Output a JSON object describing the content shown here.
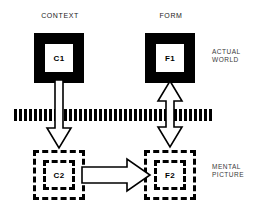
{
  "diagram": {
    "title_labels": {
      "context": "CONTEXT",
      "form": "FORM"
    },
    "tier_labels": {
      "actual_world": "ACTUAL\nWORLD",
      "mental_picture": "MENTAL\nPICTURE"
    },
    "nodes": [
      {
        "id": "c1",
        "label": "C1",
        "style": "solid-filled-square",
        "tier": "actual-world",
        "column": "context"
      },
      {
        "id": "f1",
        "label": "F1",
        "style": "solid-filled-square",
        "tier": "actual-world",
        "column": "form"
      },
      {
        "id": "c2",
        "label": "C2",
        "style": "dashed-square",
        "tier": "mental-picture",
        "column": "context"
      },
      {
        "id": "f2",
        "label": "F2",
        "style": "dashed-square",
        "tier": "mental-picture",
        "column": "form"
      }
    ],
    "edges": [
      {
        "id": "c1-c2",
        "from": "c1",
        "to": "c2",
        "direction": "down",
        "style": "hollow-block-arrow"
      },
      {
        "id": "f1-f2",
        "from": "f1",
        "to": "f2",
        "direction": "bidirectional-vertical",
        "style": "hollow-block-arrow"
      },
      {
        "id": "c2-f2",
        "from": "c2",
        "to": "f2",
        "direction": "right",
        "style": "hollow-block-arrow"
      }
    ],
    "barrier": {
      "name": "perception-barrier",
      "style": "thick-vertical-dashes",
      "dash_count": 40
    },
    "colors": {
      "ink": "#000000",
      "background": "#ffffff",
      "label_text": "#1a1a1a",
      "tier_label_text": "#3a3a3a"
    }
  }
}
